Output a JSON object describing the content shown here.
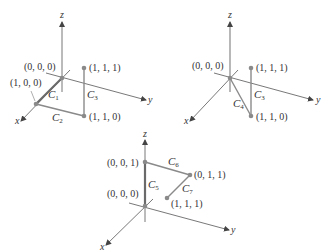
{
  "colors": {
    "axis": "#555555",
    "curve": "#8a8a8a",
    "curve_bold": "#6a6a6a",
    "point": "#8a8a8a",
    "text": "#333333",
    "background": "#ffffff"
  },
  "diagrams": [
    {
      "axes": {
        "x": "x",
        "y": "y",
        "z": "z"
      },
      "points": [
        {
          "label": "(0, 0, 0)"
        },
        {
          "label": "(1, 0, 0)"
        },
        {
          "label": "(1, 1, 1)"
        },
        {
          "label": "(1, 1, 0)"
        }
      ],
      "curves": [
        {
          "name": "C",
          "sub": "1",
          "from": "(0, 0, 0)",
          "to": "(1, 0, 0)"
        },
        {
          "name": "C",
          "sub": "2",
          "from": "(1, 0, 0)",
          "to": "(1, 1, 0)"
        },
        {
          "name": "C",
          "sub": "3",
          "from": "(1, 1, 0)",
          "to": "(1, 1, 1)"
        }
      ]
    },
    {
      "axes": {
        "x": "x",
        "y": "y",
        "z": "z"
      },
      "points": [
        {
          "label": "(0, 0, 0)"
        },
        {
          "label": "(1, 1, 1)"
        },
        {
          "label": "(1, 1, 0)"
        }
      ],
      "curves": [
        {
          "name": "C",
          "sub": "4",
          "from": "(0, 0, 0)",
          "to": "(1, 1, 0)"
        },
        {
          "name": "C",
          "sub": "3",
          "from": "(1, 1, 0)",
          "to": "(1, 1, 1)"
        }
      ]
    },
    {
      "axes": {
        "x": "x",
        "y": "y",
        "z": "z"
      },
      "points": [
        {
          "label": "(0, 0, 1)"
        },
        {
          "label": "(0, 1, 1)"
        },
        {
          "label": "(0, 0, 0)"
        },
        {
          "label": "(1, 1, 1)"
        }
      ],
      "curves": [
        {
          "name": "C",
          "sub": "5",
          "from": "(0, 0, 0)",
          "to": "(0, 0, 1)"
        },
        {
          "name": "C",
          "sub": "6",
          "from": "(0, 0, 1)",
          "to": "(0, 1, 1)"
        },
        {
          "name": "C",
          "sub": "7",
          "from": "(0, 1, 1)",
          "to": "(1, 1, 1)"
        }
      ]
    }
  ]
}
